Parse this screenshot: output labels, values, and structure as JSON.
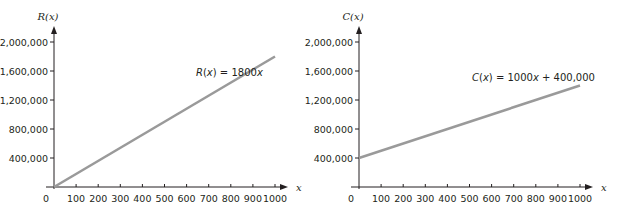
{
  "chart_data": [
    {
      "type": "line",
      "title": "",
      "xlabel": "x",
      "ylabel": "R(x)",
      "x_ticks": [
        "100",
        "200",
        "300",
        "400",
        "500",
        "600",
        "700",
        "800",
        "900",
        "1000"
      ],
      "y_ticks": [
        "400,000",
        "800,000",
        "1,200,000",
        "1,600,000",
        "2,000,000"
      ],
      "origin_label": "0",
      "xlim": [
        0,
        1000
      ],
      "ylim": [
        0,
        2000000
      ],
      "grid": false,
      "series": [
        {
          "name": "R(x) = 1800x",
          "x": [
            0,
            1000
          ],
          "y": [
            0,
            1800000
          ],
          "color": "#9a9a9a"
        }
      ],
      "annotation": {
        "func": "R(x)",
        "rhs": "1800x"
      }
    },
    {
      "type": "line",
      "title": "",
      "xlabel": "x",
      "ylabel": "C(x)",
      "x_ticks": [
        "100",
        "200",
        "300",
        "400",
        "500",
        "600",
        "700",
        "800",
        "900",
        "1000"
      ],
      "y_ticks": [
        "400,000",
        "800,000",
        "1,200,000",
        "1,600,000",
        "2,000,000"
      ],
      "origin_label": "0",
      "xlim": [
        0,
        1000
      ],
      "ylim": [
        0,
        2000000
      ],
      "grid": false,
      "series": [
        {
          "name": "C(x) = 1000x + 400,000",
          "x": [
            0,
            1000
          ],
          "y": [
            400000,
            1400000
          ],
          "color": "#9a9a9a"
        }
      ],
      "annotation": {
        "func": "C(x)",
        "rhs": "1000x + 400,000"
      }
    }
  ],
  "colors": {
    "axis": "#231f20",
    "line": "#9a9a9a",
    "text": "#231f20"
  }
}
